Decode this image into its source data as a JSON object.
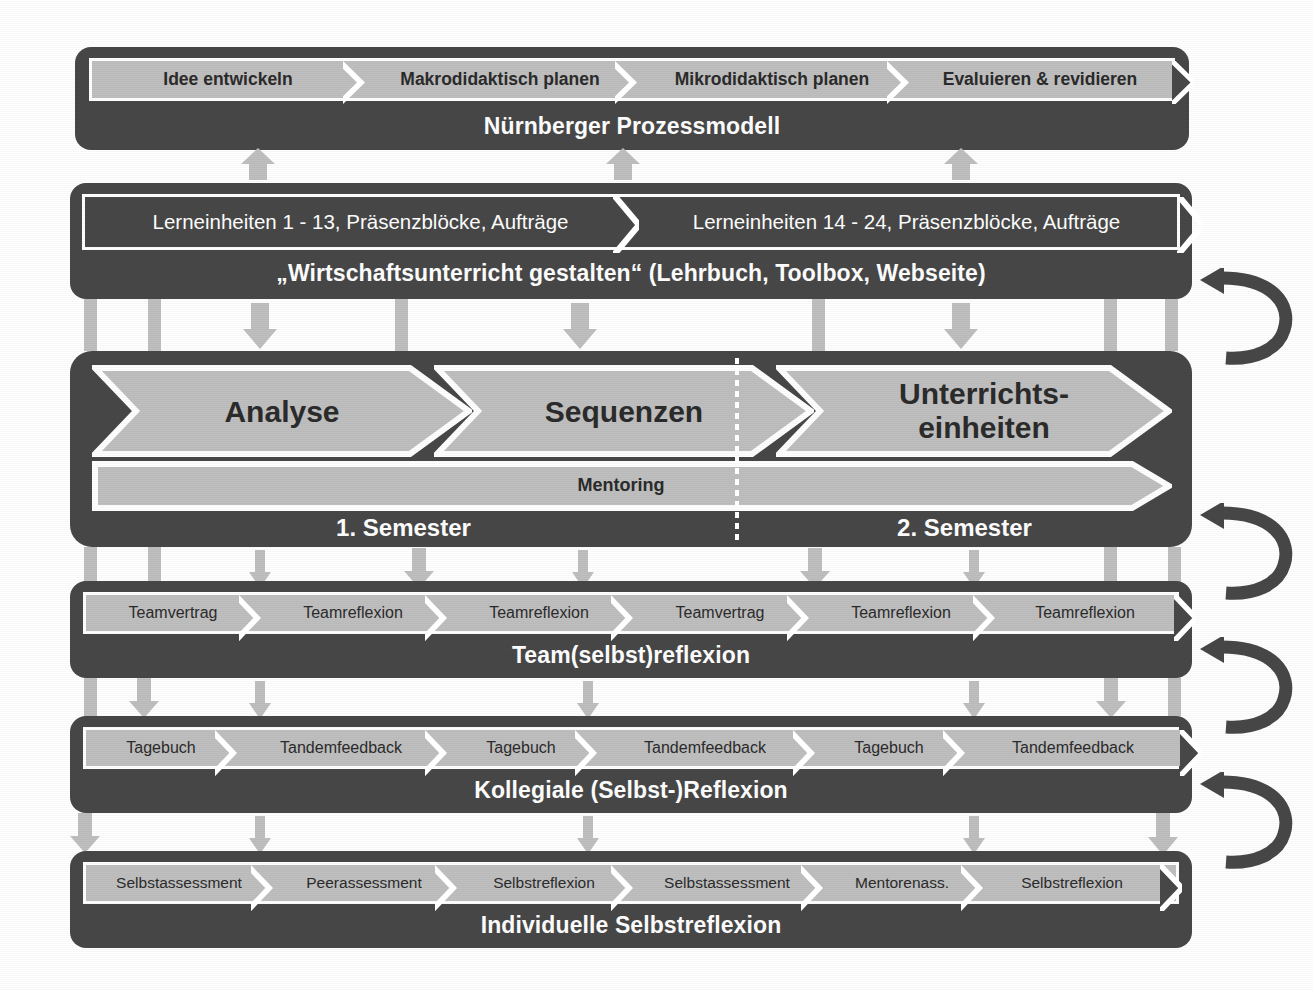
{
  "diagram": {
    "colors": {
      "band_dark": "#474747",
      "chevron_light": "#bfbfbf",
      "chevron_lighter": "#cccccc",
      "connector_gray": "#bfbfbf",
      "outline_white": "#ffffff",
      "text_dark": "#2b2b2b",
      "text_light": "#ffffff"
    },
    "rows": [
      {
        "id": "nuernberger-prozessmodell",
        "caption": "Nürnberger Prozessmodell",
        "steps": [
          "Idee entwickeln",
          "Makrodidaktisch planen",
          "Mikrodidaktisch planen",
          "Evaluieren & revidieren"
        ]
      },
      {
        "id": "wirtschaftsunterricht-gestalten",
        "caption": "„Wirtschaftsunterricht gestalten“ (Lehrbuch, Toolbox, Webseite)",
        "steps": [
          "Lerneinheiten 1 - 13, Präsenzblöcke, Aufträge",
          "Lerneinheiten 14 - 24, Präsenzblöcke, Aufträge"
        ]
      },
      {
        "id": "semesterstruktur",
        "phases": [
          "Analyse",
          "Sequenzen",
          "Unterrichts-\neinheiten"
        ],
        "phase_labels": [
          "Analyse",
          "Sequenzen",
          "Unterrichts-",
          "einheiten"
        ],
        "mentoring_label": "Mentoring",
        "semester_left": "1. Semester",
        "semester_right": "2. Semester"
      },
      {
        "id": "team-selbst-reflexion",
        "caption": "Team(selbst)reflexion",
        "steps": [
          "Teamvertrag",
          "Teamreflexion",
          "Teamreflexion",
          "Teamvertrag",
          "Teamreflexion",
          "Teamreflexion"
        ]
      },
      {
        "id": "kollegiale-selbst-reflexion",
        "caption": "Kollegiale (Selbst-)Reflexion",
        "steps": [
          "Tagebuch",
          "Tandemfeedback",
          "Tagebuch",
          "Tandemfeedback",
          "Tagebuch",
          "Tandemfeedback"
        ]
      },
      {
        "id": "individuelle-selbstreflexion",
        "caption": "Individuelle Selbstreflexion",
        "steps": [
          "Selbstassessment",
          "Peerassessment",
          "Selbstreflexion",
          "Selbstassessment",
          "Mentorenass.",
          "Selbstreflexion"
        ]
      }
    ]
  }
}
